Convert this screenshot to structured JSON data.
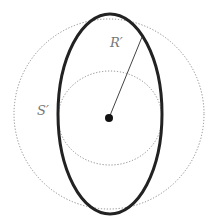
{
  "labels": {
    "R": "R′",
    "S": "S′"
  },
  "colors": {
    "dotted": "#888888",
    "ellipse": "#222222",
    "line": "#444444",
    "dot": "#111111"
  }
}
